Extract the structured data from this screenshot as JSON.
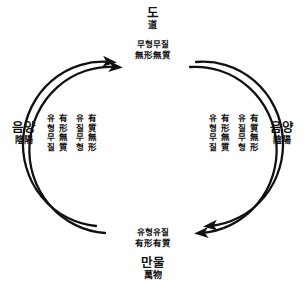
{
  "diagram": {
    "title_top": {
      "korean": "도",
      "hanja": "道"
    },
    "title_bottom": {
      "korean": "만물",
      "hanja": "萬物"
    },
    "state_top": {
      "korean": "무형무질",
      "hanja": "無形無質"
    },
    "state_bottom": {
      "korean": "유형유질",
      "hanja": "有形有質"
    },
    "side_label_left": {
      "korean": "음양",
      "hanja": "陰陽"
    },
    "side_label_right": {
      "korean": "음양",
      "hanja": "陰陽"
    },
    "inner_left": [
      {
        "korean": "유형무질",
        "hanja": "有形無質"
      },
      {
        "korean": "유질무형",
        "hanja": "有質無形"
      }
    ],
    "inner_right": [
      {
        "korean": "유형무질",
        "hanja": "有形無質"
      },
      {
        "korean": "유질무형",
        "hanja": "有質無形"
      }
    ],
    "stroke_color": "#111111"
  }
}
